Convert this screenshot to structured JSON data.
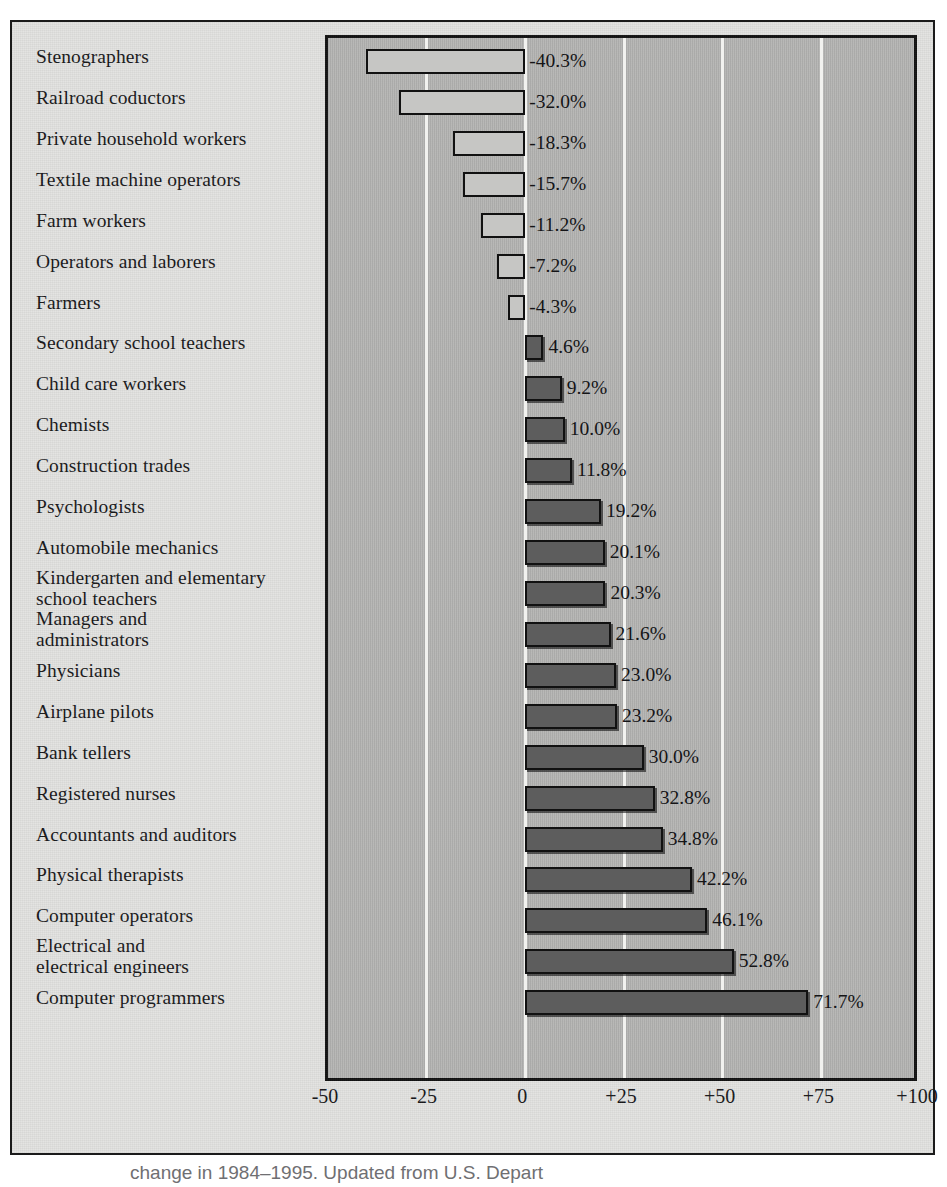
{
  "chart_data": {
    "type": "bar",
    "orientation": "horizontal",
    "title": "",
    "xlabel": "",
    "ylabel": "",
    "xlim": [
      -50,
      100
    ],
    "grid": true,
    "legend": null,
    "tick_labels": [
      "-50",
      "-25",
      "0",
      "+25",
      "+50",
      "+75",
      "+100"
    ],
    "tick_values": [
      -50,
      -25,
      0,
      25,
      50,
      75,
      100
    ],
    "categories": [
      "Stenographers",
      "Railroad coductors",
      "Private household workers",
      "Textile machine operators",
      "Farm workers",
      "Operators and laborers",
      "Farmers",
      "Secondary school teachers",
      "Child care workers",
      "Chemists",
      "Construction trades",
      "Psychologists",
      "Automobile mechanics",
      "Kindergarten and elementary\nschool teachers",
      "Managers and\nadministrators",
      "Physicians",
      "Airplane pilots",
      "Bank tellers",
      "Registered nurses",
      "Accountants and auditors",
      "Physical therapists",
      "Computer operators",
      "Electrical and\nelectrical engineers",
      "Computer programmers"
    ],
    "values": [
      -40.3,
      -32.0,
      -18.3,
      -15.7,
      -11.2,
      -7.2,
      -4.3,
      4.6,
      9.2,
      10.0,
      11.8,
      19.2,
      20.1,
      20.3,
      21.6,
      23.0,
      23.2,
      30.0,
      32.8,
      34.8,
      42.2,
      46.1,
      52.8,
      71.7
    ],
    "value_labels": [
      "-40.3%",
      "-32.0%",
      "-18.3%",
      "-15.7%",
      "-11.2%",
      "-7.2%",
      "-4.3%",
      "4.6%",
      "9.2%",
      "10.0%",
      "11.8%",
      "19.2%",
      "20.1%",
      "20.3%",
      "21.6%",
      "23.0%",
      "23.2%",
      "30.0%",
      "32.8%",
      "34.8%",
      "42.2%",
      "46.1%",
      "52.8%",
      "71.7%"
    ]
  },
  "colors": {
    "page_background": "#e3e3e1",
    "plot_background": "#b9b9b7",
    "gridline": "#f2f2ef",
    "negative_bar_fill": "#c6c6c4",
    "positive_bar_fill": "#5d5d5d",
    "bar_outline": "#111111",
    "frame": "#1b1b1b",
    "text": "#18181a"
  },
  "caption": {
    "text": "change in 1984–1995. Updated from U.S. Depart"
  }
}
